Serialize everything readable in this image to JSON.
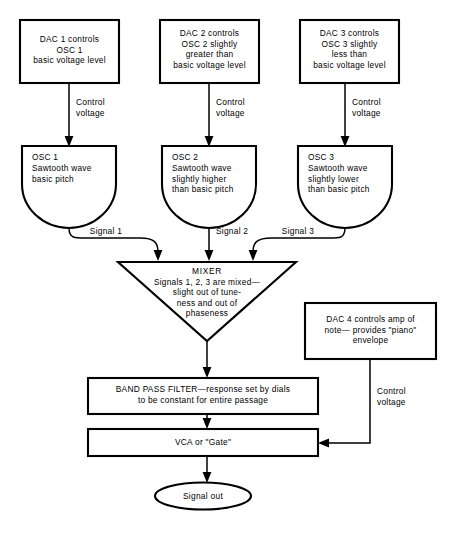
{
  "diagram": {
    "background_color": "#ffffff",
    "stroke_color": "#000000",
    "nodes": {
      "dac1": {
        "label": "DAC 1 controls\nOSC 1\nbasic voltage level",
        "shape": "rectangle"
      },
      "dac2": {
        "label": "DAC 2 controls\nOSC 2 slightly\ngreater than\nbasic voltage level",
        "shape": "rectangle"
      },
      "dac3": {
        "label": "DAC 3 controls\nOSC 3 slightly\nless than\nbasic voltage level",
        "shape": "rectangle"
      },
      "dac4": {
        "label": "DAC 4 controls amp of\nnote— provides \"piano\"\nenvelope",
        "shape": "rectangle"
      },
      "osc1": {
        "label": "OSC 1\nSawtooth wave\nbasic pitch",
        "shape": "d-shape"
      },
      "osc2": {
        "label": "OSC 2\nSawtooth wave\nslightly higher\nthan basic pitch",
        "shape": "d-shape"
      },
      "osc3": {
        "label": "OSC 3\nSawtooth wave\nslightly lower\nthan basic pitch",
        "shape": "d-shape"
      },
      "mixer": {
        "title": "MIXER",
        "body": "Signals 1, 2, 3 are mixed—\nslight out of tune-\nness and out of\nphaseness",
        "shape": "inverted-triangle"
      },
      "bandpass": {
        "label": "BAND PASS FILTER—response set by dials\nto be constant for entire passage",
        "shape": "rectangle"
      },
      "vca": {
        "label": "VCA or \"Gate\"",
        "shape": "rectangle"
      },
      "signalout": {
        "label": "Signal out",
        "shape": "ellipse"
      }
    },
    "edges": [
      {
        "id": "cv1",
        "label": "Control\nvoltage",
        "from": "dac1",
        "to": "osc1"
      },
      {
        "id": "cv2",
        "label": "Control\nvoltage",
        "from": "dac2",
        "to": "osc2"
      },
      {
        "id": "cv3",
        "label": "Control\nvoltage",
        "from": "dac3",
        "to": "osc3"
      },
      {
        "id": "sig1",
        "label": "Signal 1",
        "from": "osc1",
        "to": "mixer"
      },
      {
        "id": "sig2",
        "label": "Signal 2",
        "from": "osc2",
        "to": "mixer"
      },
      {
        "id": "sig3",
        "label": "Signal 3",
        "from": "osc3",
        "to": "mixer"
      },
      {
        "id": "mix-bpf",
        "label": "",
        "from": "mixer",
        "to": "bandpass"
      },
      {
        "id": "bpf-vca",
        "label": "",
        "from": "bandpass",
        "to": "vca"
      },
      {
        "id": "cv4",
        "label": "Control\nvoltage",
        "from": "dac4",
        "to": "vca"
      },
      {
        "id": "vca-out",
        "label": "",
        "from": "vca",
        "to": "signalout"
      }
    ]
  }
}
